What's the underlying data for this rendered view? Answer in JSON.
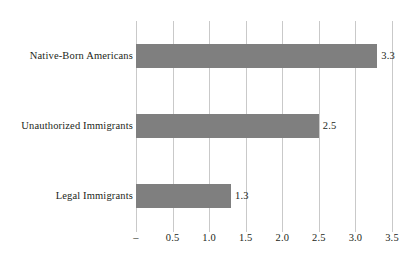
{
  "chart_data": {
    "type": "bar",
    "orientation": "horizontal",
    "title": "",
    "subtitle": "",
    "xlabel": "",
    "ylabel": "",
    "categories": [
      "Legal Immigrants",
      "Unauthorized Immigrants",
      "Native-Born Americans"
    ],
    "values": [
      1.3,
      2.5,
      3.3
    ],
    "value_labels": [
      "1.3",
      "2.5",
      "3.3"
    ],
    "xlim": [
      0,
      3.5
    ],
    "xticks": [
      0,
      0.5,
      1.0,
      1.5,
      2.0,
      2.5,
      3.0,
      3.5
    ],
    "xtick_labels": [
      "–",
      "0.5",
      "1.0",
      "1.5",
      "2.0",
      "2.5",
      "3.0",
      "3.5"
    ],
    "grid": true,
    "grid_axis": "x",
    "legend": false,
    "legend_position": "none",
    "series": [
      {
        "name": "",
        "values": [
          1.3,
          2.5,
          3.3
        ]
      }
    ],
    "bars": [
      {
        "category": "Native-Born Americans",
        "value": 3.3,
        "label": "3.3"
      },
      {
        "category": "Unauthorized Immigrants",
        "value": 2.5,
        "label": "2.5"
      },
      {
        "category": "Legal Immigrants",
        "value": 1.3,
        "label": "1.3"
      }
    ]
  },
  "colors": {
    "bar_fill": "#7f7f7f",
    "gridline": "#c9c9c9",
    "text": "#231f20",
    "background": "#ffffff"
  }
}
